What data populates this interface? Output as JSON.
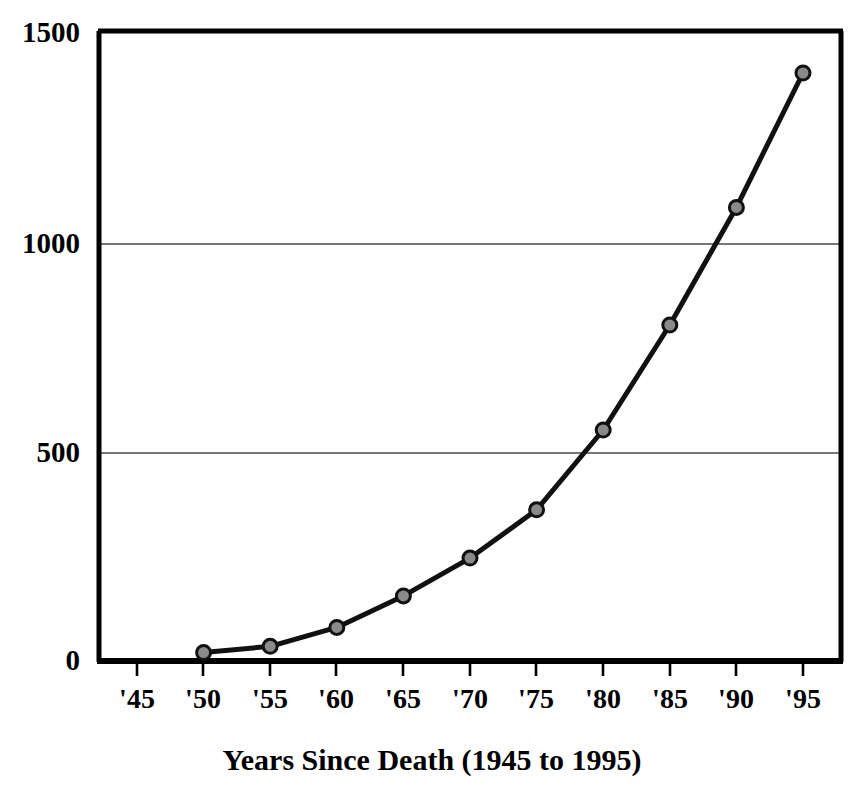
{
  "chart_data": {
    "type": "line",
    "title": "",
    "subtitle": "",
    "xlabel": "Years Since Death (1945 to 1995)",
    "ylabel": "",
    "x": [
      "'45",
      "'50",
      "'55",
      "'60",
      "'65",
      "'70",
      "'75",
      "'80",
      "'85",
      "'90",
      "'95"
    ],
    "categories": [
      "'45",
      "'50",
      "'55",
      "'60",
      "'65",
      "'70",
      "'75",
      "'80",
      "'85",
      "'90",
      "'95"
    ],
    "values": [
      null,
      20,
      35,
      80,
      155,
      245,
      360,
      550,
      800,
      1080,
      1400
    ],
    "series": [
      {
        "name": "",
        "values": [
          null,
          20,
          35,
          80,
          155,
          245,
          360,
          550,
          800,
          1080,
          1400
        ]
      }
    ],
    "xlim": [
      "'45",
      "'95"
    ],
    "ylim": [
      0,
      1500
    ],
    "ytick_labels": [
      "0",
      "500",
      "1000",
      "1500"
    ],
    "ytick_values": [
      0,
      500,
      1000,
      1500
    ],
    "xtick_labels": [
      "'45",
      "'50",
      "'55",
      "'60",
      "'65",
      "'70",
      "'75",
      "'80",
      "'85",
      "'90",
      "'95"
    ],
    "grid": "horizontal",
    "gridlines_at": [
      500,
      1000
    ],
    "legend": "none",
    "marker": "circle",
    "marker_fill": "#8a8a8a",
    "marker_edge": "#111111",
    "line_color": "#111111",
    "line_width": 5,
    "axis_color": "#000000",
    "grid_color": "#555555",
    "background": "#ffffff"
  },
  "axis": {
    "y_labels": [
      "1500",
      "1000",
      "500",
      "0"
    ],
    "x_labels": [
      "'45",
      "'50",
      "'55",
      "'60",
      "'65",
      "'70",
      "'75",
      "'80",
      "'85",
      "'90",
      "'95"
    ],
    "x_axis_title": "Years Since Death (1945 to 1995)"
  }
}
